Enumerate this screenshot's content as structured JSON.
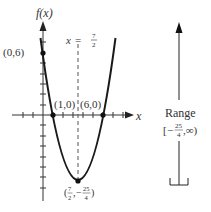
{
  "figure": {
    "function_label": "f(x)",
    "x_axis_label": "x",
    "axis_of_symmetry": {
      "lhs": "x",
      "eq": "=",
      "num": "7",
      "den": "2"
    },
    "points": {
      "y_intercept": "(0,6)",
      "root_1": "(1,0)",
      "root_2": "(6,0)",
      "vertex": {
        "open": "(",
        "x_num": "7",
        "x_den": "2",
        "sep": ",",
        "y_sign": "−",
        "y_num": "25",
        "y_den": "4",
        "close": ")"
      }
    },
    "range": {
      "title": "Range",
      "open": "[",
      "sign": "−",
      "num": "25",
      "den": "4",
      "rest": ",∞)"
    },
    "colors": {
      "curve": "#1a1a1a",
      "axis": "#333333",
      "dashed": "#555555"
    }
  }
}
